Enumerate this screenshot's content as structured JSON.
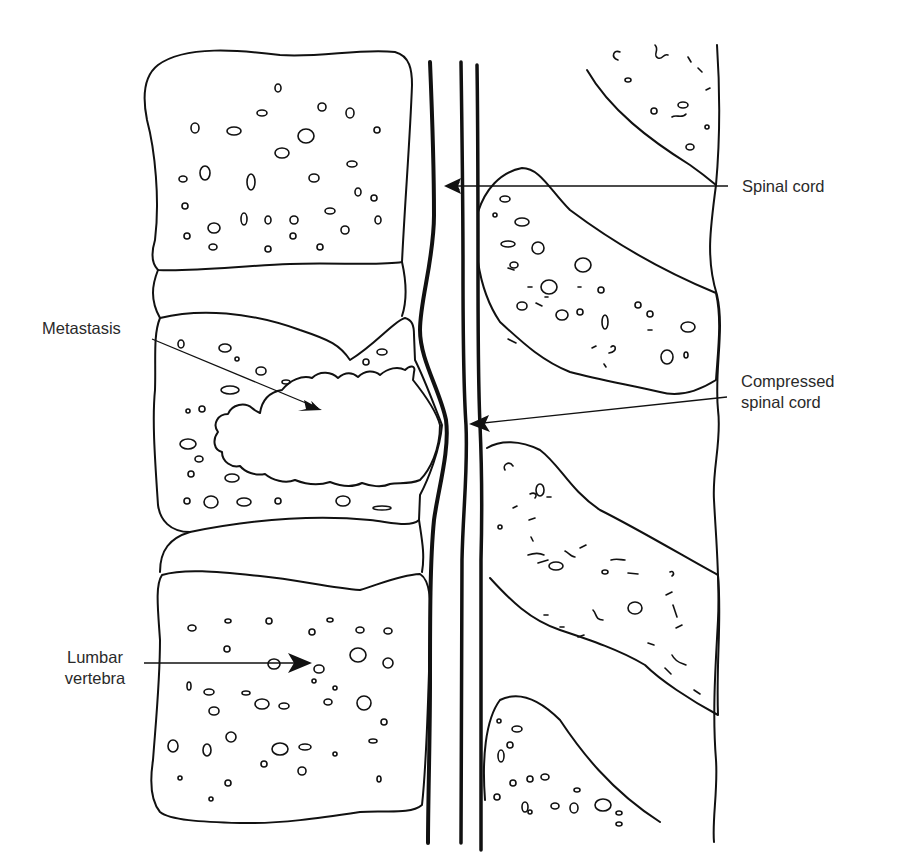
{
  "figure": {
    "type": "anatomical line drawing",
    "labels": {
      "spinal_cord": "Spinal cord",
      "metastasis": "Metastasis",
      "compressed_line1": "Compressed",
      "compressed_line2": "spinal cord",
      "lumbar_line1": "Lumbar",
      "lumbar_line2": "vertebra"
    },
    "colors": {
      "ink": "#111111",
      "label_text": "#2a2a2a",
      "background": "#ffffff"
    }
  }
}
